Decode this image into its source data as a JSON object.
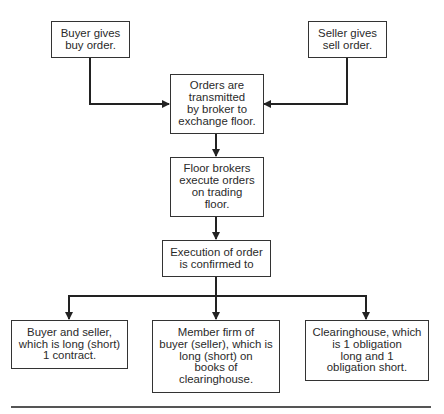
{
  "diagram": {
    "nodes": [
      {
        "id": "buyer",
        "label": "Buyer gives\nbuy order."
      },
      {
        "id": "seller",
        "label": "Seller gives\nsell order."
      },
      {
        "id": "transmit",
        "label": "Orders are\ntransmitted\nby broker to\nexchange floor."
      },
      {
        "id": "execute",
        "label": "Floor brokers\nexecute orders\non trading\nfloor."
      },
      {
        "id": "confirm",
        "label": "Execution of order\nis confirmed to"
      },
      {
        "id": "parties",
        "label": "Buyer and seller,\nwhich is long (short)\n1 contract."
      },
      {
        "id": "member",
        "label": "Member firm of\nbuyer (seller), which is\nlong (short) on\nbooks of\nclearinghouse."
      },
      {
        "id": "clearing",
        "label": "Clearinghouse, which\nis 1 obligation\nlong and 1\nobligation short."
      }
    ],
    "edges": [
      {
        "from": "buyer",
        "to": "transmit"
      },
      {
        "from": "seller",
        "to": "transmit"
      },
      {
        "from": "transmit",
        "to": "execute"
      },
      {
        "from": "execute",
        "to": "confirm"
      },
      {
        "from": "confirm",
        "to": "parties"
      },
      {
        "from": "confirm",
        "to": "member"
      },
      {
        "from": "confirm",
        "to": "clearing"
      }
    ]
  }
}
